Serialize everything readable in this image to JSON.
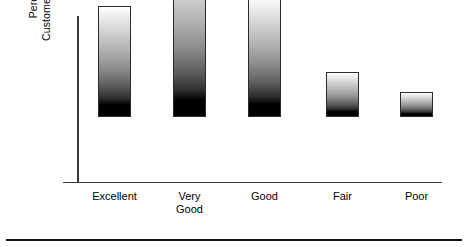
{
  "chart_data": {
    "type": "bar",
    "title": "",
    "xlabel": "",
    "ylabel": "Percentage of Customers Responding",
    "ylabel_lines": [
      "Percentage of",
      "Customers Responding"
    ],
    "categories": [
      "Excellent",
      "Very\nGood",
      "Good",
      "Fair",
      "Poor"
    ],
    "category_labels_flat": [
      "Excellent",
      "Very Good",
      "Good",
      "Fair",
      "Poor"
    ],
    "values": [
      67,
      96,
      73,
      27,
      15
    ],
    "ylim": [
      0,
      100
    ],
    "grid": false,
    "legend": false,
    "axis_tick_labels": [],
    "bar_style": "vertical-gradient-white-to-black",
    "bar_edge_color": "#2b2b2b",
    "axis_color": "#3a3a3a",
    "background_color": "#ffffff"
  },
  "figure": {
    "bottom_rule_color": "#111111"
  }
}
